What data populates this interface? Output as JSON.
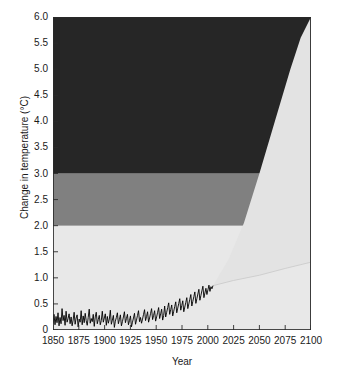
{
  "chart_data": {
    "type": "area",
    "title": "",
    "xlabel": "Year",
    "ylabel": "Change in temperature (°C)",
    "xlim": [
      1850,
      2100
    ],
    "ylim": [
      0,
      6.0
    ],
    "grid": false,
    "legend": "none",
    "xticks": [
      1850,
      1875,
      1900,
      1925,
      1950,
      1975,
      2000,
      2025,
      2050,
      2075,
      2100
    ],
    "xtick_labels": [
      "1850",
      "1875",
      "1900",
      "1925",
      "1950",
      "1975",
      "2000",
      "2025",
      "2050",
      "2075",
      "2100"
    ],
    "yticks": [
      0,
      0.5,
      1.0,
      1.5,
      2.0,
      2.5,
      3.0,
      3.5,
      4.0,
      4.5,
      5.0,
      5.5,
      6.0
    ],
    "ytick_labels": [
      "0",
      "0.5",
      "1.0",
      "1.5",
      "2.0",
      "2.5",
      "3.0",
      "3.5",
      "4.0",
      "4.5",
      "5.0",
      "5.5",
      "6.0"
    ],
    "bands": [
      {
        "name": "low-risk-band",
        "from": 0,
        "to": 2.0,
        "color": "#e8e8e8"
      },
      {
        "name": "medium-risk-band",
        "from": 2.0,
        "to": 3.0,
        "color": "#808080"
      },
      {
        "name": "high-risk-band",
        "from": 3.0,
        "to": 6.0,
        "color": "#262626"
      }
    ],
    "projection_wedge": {
      "name": "projection-uncertainty-wedge",
      "color": "#e3e3e3",
      "start_year": 2005,
      "start_value": 0.85,
      "upper_bound": {
        "x": [
          2005,
          2020,
          2035,
          2050,
          2065,
          2080,
          2090,
          2100
        ],
        "y": [
          0.85,
          1.35,
          2.05,
          3.0,
          4.0,
          5.0,
          5.6,
          6.0
        ]
      },
      "lower_bound": {
        "x": [
          2005,
          2025,
          2050,
          2075,
          2100
        ],
        "y": [
          0.85,
          0.95,
          1.05,
          1.18,
          1.3
        ]
      }
    },
    "series": [
      {
        "name": "observed-temperature",
        "label": "Observed change in temperature",
        "color": "#000000",
        "x_start": 1850,
        "x_end": 2005,
        "y_min": 0.02,
        "y_max": 0.88,
        "values": [
          0.12,
          0.3,
          0.1,
          0.26,
          0.14,
          0.33,
          0.08,
          0.24,
          0.12,
          0.41,
          0.18,
          0.28,
          0.09,
          0.36,
          0.15,
          0.22,
          0.31,
          0.12,
          0.25,
          0.08,
          0.19,
          0.34,
          0.11,
          0.23,
          0.29,
          0.06,
          0.21,
          0.15,
          0.37,
          0.1,
          0.27,
          0.14,
          0.32,
          0.18,
          0.09,
          0.24,
          0.4,
          0.13,
          0.22,
          0.16,
          0.3,
          0.07,
          0.25,
          0.34,
          0.12,
          0.2,
          0.28,
          0.1,
          0.18,
          0.36,
          0.15,
          0.23,
          0.31,
          0.09,
          0.26,
          0.13,
          0.21,
          0.38,
          0.11,
          0.19,
          0.28,
          0.05,
          0.17,
          0.24,
          0.33,
          0.12,
          0.2,
          0.29,
          0.08,
          0.16,
          0.25,
          0.35,
          0.14,
          0.22,
          0.3,
          0.1,
          0.18,
          0.27,
          0.06,
          0.15,
          0.23,
          0.32,
          0.11,
          0.19,
          0.28,
          0.37,
          0.16,
          0.24,
          0.13,
          0.21,
          0.3,
          0.39,
          0.18,
          0.26,
          0.35,
          0.15,
          0.23,
          0.32,
          0.41,
          0.2,
          0.28,
          0.37,
          0.17,
          0.25,
          0.34,
          0.43,
          0.22,
          0.31,
          0.4,
          0.19,
          0.28,
          0.46,
          0.25,
          0.34,
          0.43,
          0.52,
          0.3,
          0.39,
          0.48,
          0.27,
          0.36,
          0.45,
          0.54,
          0.33,
          0.42,
          0.51,
          0.6,
          0.38,
          0.47,
          0.56,
          0.35,
          0.44,
          0.53,
          0.62,
          0.41,
          0.5,
          0.59,
          0.68,
          0.46,
          0.55,
          0.64,
          0.73,
          0.51,
          0.6,
          0.69,
          0.78,
          0.57,
          0.66,
          0.75,
          0.84,
          0.62,
          0.71,
          0.8,
          0.68,
          0.77,
          0.86,
          0.74,
          0.83,
          0.79,
          0.85
        ]
      }
    ]
  },
  "axes": {
    "y_title": "Change in temperature (°C)",
    "x_title": "Year"
  },
  "caption": {
    "text": ""
  }
}
